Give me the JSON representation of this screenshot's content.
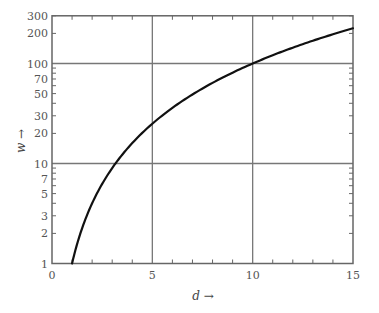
{
  "chart_data": {
    "type": "line",
    "title": "",
    "xlabel": "d →",
    "ylabel": "w →",
    "xscale": "linear",
    "yscale": "log",
    "xlim": [
      0,
      15
    ],
    "ylim": [
      1,
      300
    ],
    "x_ticks": [
      0,
      5,
      10,
      15
    ],
    "x_tick_labels": [
      "0",
      "5",
      "10",
      "15"
    ],
    "x_minor_ticks": [
      1,
      2,
      3,
      4,
      6,
      7,
      8,
      9,
      11,
      12,
      13,
      14
    ],
    "y_tick_values": [
      1,
      2,
      3,
      5,
      7,
      10,
      20,
      30,
      50,
      70,
      100,
      200,
      300
    ],
    "y_tick_labels": [
      "1",
      "2",
      "3",
      "5",
      "7",
      "10",
      "20",
      "30",
      "50",
      "70",
      "100",
      "200",
      "300"
    ],
    "y_minor_ticks": [
      2,
      3,
      4,
      5,
      6,
      7,
      8,
      9,
      20,
      30,
      40,
      50,
      60,
      70,
      80,
      90,
      200,
      300
    ],
    "grid": {
      "x_lines": [
        5,
        10
      ],
      "y_lines": [
        10,
        100
      ]
    },
    "legend": null,
    "series": [
      {
        "name": "w = d^2",
        "x": [
          1,
          1.5,
          2,
          2.5,
          3,
          3.5,
          4,
          5,
          6,
          7,
          8,
          9,
          10,
          11,
          12,
          13,
          14,
          15
        ],
        "values": [
          1,
          2.25,
          4,
          6.25,
          9,
          12.25,
          16,
          25,
          36,
          49,
          64,
          81,
          100,
          121,
          144,
          169,
          196,
          225
        ]
      }
    ],
    "colors": {
      "axis": "#666666",
      "grid": "#777777",
      "curve": "#111111",
      "text": "#555555"
    }
  }
}
